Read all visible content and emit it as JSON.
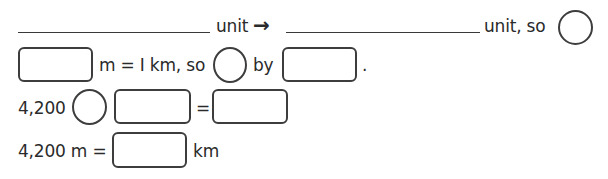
{
  "row1": {
    "text_a": "unit",
    "arrow": "→",
    "text_b": "unit, so"
  },
  "row2": {
    "text_a": "m = I km, so",
    "text_b": "by",
    "period": "."
  },
  "row3": {
    "number": "4,200",
    "equals": "="
  },
  "row4": {
    "text_a": "4,200 m =",
    "unit": "km"
  }
}
